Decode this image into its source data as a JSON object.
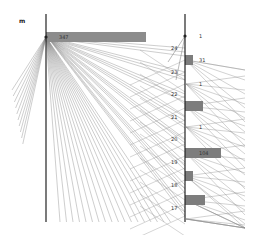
{
  "chart_data": {
    "type": "parallel-sets",
    "title": "",
    "axes": [
      {
        "name": "m",
        "x": 46,
        "y_top": 14,
        "y_bottom": 222
      },
      {
        "name": "",
        "x": 185,
        "y_top": 14,
        "y_bottom": 222
      }
    ],
    "left_categories": [
      {
        "label": "347",
        "y": 37,
        "bar_width": 100
      }
    ],
    "right_categories": [
      {
        "label": "1",
        "y": 36,
        "bar_width": 0
      },
      {
        "label": "31",
        "y": 60,
        "bar_width": 8
      },
      {
        "label": "1",
        "y": 84,
        "bar_width": 0
      },
      {
        "label": "",
        "y": 106,
        "bar_width": 18
      },
      {
        "label": "1",
        "y": 127,
        "bar_width": 0
      },
      {
        "label": "104",
        "y": 153,
        "bar_width": 36
      },
      {
        "label": "",
        "y": 176,
        "bar_width": 8
      },
      {
        "label": "",
        "y": 200,
        "bar_width": 20
      },
      {
        "label": "",
        "y": 219,
        "bar_width": 0
      }
    ],
    "axis_ticks_between": [
      "24",
      "23",
      "22",
      "21",
      "20",
      "19",
      "18",
      "17"
    ],
    "tick_positions_y": [
      48,
      72,
      94,
      117,
      139,
      162,
      185,
      208
    ],
    "grid": false,
    "legend": "none"
  },
  "labels": {
    "left_axis": "m",
    "top_bar_value": "347"
  }
}
